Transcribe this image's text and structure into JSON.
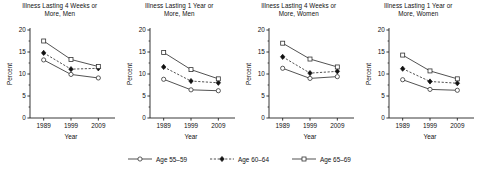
{
  "figure": {
    "background": "#ffffff",
    "axis_color": "#222222",
    "line_color": "#333333"
  },
  "legend": {
    "position": "bottom-center",
    "items": [
      {
        "label": "Age 55–59",
        "marker": "open-circle",
        "line": "solid",
        "name": "legend-age-55-59"
      },
      {
        "label": "Age 60–64",
        "marker": "filled-diamond",
        "line": "dashed",
        "name": "legend-age-60-64"
      },
      {
        "label": "Age 65–69",
        "marker": "open-square",
        "line": "solid",
        "name": "legend-age-65-69"
      }
    ]
  },
  "chart_data": [
    {
      "type": "line",
      "title": "Illness Lasting 4 Weeks or\nMore, Men",
      "xlabel": "Year",
      "ylabel": "Percent",
      "categories": [
        "1989",
        "1999",
        "2009"
      ],
      "x": [
        1989,
        1999,
        2009
      ],
      "xlim": [
        1984,
        2014
      ],
      "ylim": [
        0,
        20
      ],
      "yticks": [
        0,
        5,
        10,
        15,
        20
      ],
      "ytick_labels": [
        "0",
        "5",
        "10",
        "15",
        "20"
      ],
      "grid": false,
      "series": [
        {
          "name": "Age 55–59",
          "marker": "open-circle",
          "line": "solid",
          "values": [
            13.2,
            9.9,
            9.1
          ]
        },
        {
          "name": "Age 60–64",
          "marker": "filled-diamond",
          "line": "dashed",
          "values": [
            14.8,
            11.1,
            11.3
          ]
        },
        {
          "name": "Age 65–69",
          "marker": "open-square",
          "line": "solid",
          "values": [
            17.5,
            13.3,
            11.7
          ]
        }
      ]
    },
    {
      "type": "line",
      "title": "Illness Lasting 1 Year or\nMore, Men",
      "xlabel": "Year",
      "ylabel": "Percent",
      "categories": [
        "1989",
        "1999",
        "2009"
      ],
      "x": [
        1989,
        1999,
        2009
      ],
      "xlim": [
        1984,
        2014
      ],
      "ylim": [
        0,
        20
      ],
      "yticks": [
        0,
        5,
        10,
        15,
        20
      ],
      "ytick_labels": [
        "0",
        "5",
        "10",
        "15",
        "20"
      ],
      "grid": false,
      "series": [
        {
          "name": "Age 55–59",
          "marker": "open-circle",
          "line": "solid",
          "values": [
            8.8,
            6.4,
            6.2
          ]
        },
        {
          "name": "Age 60–64",
          "marker": "filled-diamond",
          "line": "dashed",
          "values": [
            11.6,
            8.4,
            8.0
          ]
        },
        {
          "name": "Age 65–69",
          "marker": "open-square",
          "line": "solid",
          "values": [
            14.9,
            11.0,
            8.9
          ]
        }
      ]
    },
    {
      "type": "line",
      "title": "Illness Lasting 4 Weeks or\nMore, Women",
      "xlabel": "Year",
      "ylabel": "Percent",
      "categories": [
        "1989",
        "1999",
        "2009"
      ],
      "x": [
        1989,
        1999,
        2009
      ],
      "xlim": [
        1984,
        2014
      ],
      "ylim": [
        0,
        20
      ],
      "yticks": [
        0,
        5,
        10,
        15,
        20
      ],
      "ytick_labels": [
        "0",
        "5",
        "10",
        "15",
        "20"
      ],
      "grid": false,
      "series": [
        {
          "name": "Age 55–59",
          "marker": "open-circle",
          "line": "solid",
          "values": [
            11.3,
            9.0,
            9.4
          ]
        },
        {
          "name": "Age 60–64",
          "marker": "filled-diamond",
          "line": "dashed",
          "values": [
            13.9,
            10.2,
            10.6
          ]
        },
        {
          "name": "Age 65–69",
          "marker": "open-square",
          "line": "solid",
          "values": [
            17.0,
            13.4,
            11.6
          ]
        }
      ]
    },
    {
      "type": "line",
      "title": "Illness Lasting 1 Year or\nMore, Women",
      "xlabel": "Year",
      "ylabel": "Percent",
      "categories": [
        "1989",
        "1999",
        "2009"
      ],
      "x": [
        1989,
        1999,
        2009
      ],
      "xlim": [
        1984,
        2014
      ],
      "ylim": [
        0,
        20
      ],
      "yticks": [
        0,
        5,
        10,
        15,
        20
      ],
      "ytick_labels": [
        "0",
        "5",
        "10",
        "15",
        "20"
      ],
      "grid": false,
      "series": [
        {
          "name": "Age 55–59",
          "marker": "open-circle",
          "line": "solid",
          "values": [
            8.7,
            6.5,
            6.3
          ]
        },
        {
          "name": "Age 60–64",
          "marker": "filled-diamond",
          "line": "dashed",
          "values": [
            11.2,
            8.3,
            7.9
          ]
        },
        {
          "name": "Age 65–69",
          "marker": "open-square",
          "line": "solid",
          "values": [
            14.3,
            10.7,
            8.9
          ]
        }
      ]
    }
  ]
}
